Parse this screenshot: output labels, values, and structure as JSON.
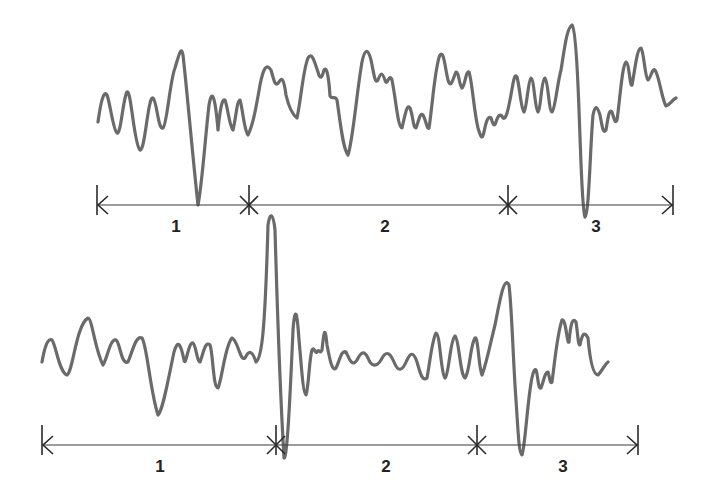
{
  "diagram": {
    "type": "waveform-segmentation",
    "stroke_color": "#6a6a6a",
    "axis_color": "#3a3a3a",
    "traces": [
      {
        "id": "top",
        "segments": [
          {
            "label": "1",
            "x_start": 97,
            "x_end": 249
          },
          {
            "label": "2",
            "x_start": 249,
            "x_end": 508
          },
          {
            "label": "3",
            "x_start": 508,
            "x_end": 673
          }
        ]
      },
      {
        "id": "bottom",
        "segments": [
          {
            "label": "1",
            "x_start": 42,
            "x_end": 276
          },
          {
            "label": "2",
            "x_start": 276,
            "x_end": 477
          },
          {
            "label": "3",
            "x_start": 477,
            "x_end": 638
          }
        ]
      }
    ]
  }
}
